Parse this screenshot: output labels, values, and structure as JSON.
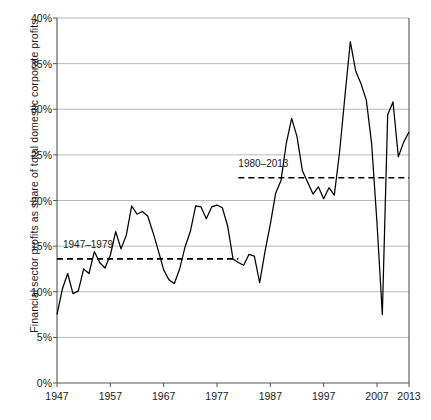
{
  "chart_data": {
    "type": "line",
    "title": "",
    "xlabel": "",
    "ylabel": "Financial sector profits as share of total domestic corporate profits",
    "xlim": [
      1947,
      2013
    ],
    "ylim": [
      0,
      40
    ],
    "yunit": "%",
    "ytick_labels": [
      "0%",
      "5%",
      "10%",
      "15%",
      "20%",
      "25%",
      "30%",
      "35%",
      "40%"
    ],
    "ytick_values": [
      0,
      5,
      10,
      15,
      20,
      25,
      30,
      35,
      40
    ],
    "xtick_labels": [
      "1947",
      "1957",
      "1967",
      "1977",
      "1987",
      "1997",
      "2007",
      "2013"
    ],
    "xtick_values": [
      1947,
      1957,
      1967,
      1977,
      1987,
      1997,
      2007,
      2013
    ],
    "grid": "horizontal",
    "legend": "none",
    "line_color": "#000000",
    "grid_color": "#b0b0b0",
    "axis_color": "#555555",
    "x": [
      1947,
      1948,
      1949,
      1950,
      1951,
      1952,
      1953,
      1954,
      1955,
      1956,
      1957,
      1958,
      1959,
      1960,
      1961,
      1962,
      1963,
      1964,
      1965,
      1966,
      1967,
      1968,
      1969,
      1970,
      1971,
      1972,
      1973,
      1974,
      1975,
      1976,
      1977,
      1978,
      1979,
      1980,
      1981,
      1982,
      1983,
      1984,
      1985,
      1986,
      1987,
      1988,
      1989,
      1990,
      1991,
      1992,
      1993,
      1994,
      1995,
      1996,
      1997,
      1998,
      1999,
      2000,
      2001,
      2002,
      2003,
      2004,
      2005,
      2006,
      2007,
      2008,
      2009,
      2010,
      2011,
      2012,
      2013
    ],
    "values": [
      7.5,
      10.3,
      12.0,
      9.8,
      10.1,
      12.5,
      12.0,
      14.4,
      13.2,
      12.6,
      14.0,
      16.6,
      14.7,
      16.2,
      19.4,
      18.5,
      18.8,
      18.3,
      16.5,
      14.5,
      12.4,
      11.3,
      10.9,
      12.5,
      14.9,
      16.6,
      19.4,
      19.3,
      18.0,
      19.3,
      19.5,
      19.2,
      17.2,
      13.6,
      13.2,
      12.9,
      14.1,
      13.9,
      11.0,
      14.4,
      17.4,
      20.8,
      22.2,
      26.3,
      29.0,
      27.0,
      23.3,
      22.0,
      20.7,
      21.5,
      20.2,
      21.4,
      20.6,
      25.4,
      31.5,
      37.4,
      34.2,
      32.8,
      31.0,
      26.2,
      17.5,
      7.5,
      29.4,
      30.8,
      24.8,
      26.4,
      27.5
    ],
    "annotations": [
      {
        "id": "period-1",
        "label": "1947–1979",
        "level": 13.6,
        "x_start": 1947,
        "x_end": 1981,
        "style": "dashed"
      },
      {
        "id": "period-2",
        "label": "1980–2013",
        "level": 22.5,
        "x_start": 1981,
        "x_end": 2013,
        "style": "dashed"
      }
    ]
  }
}
